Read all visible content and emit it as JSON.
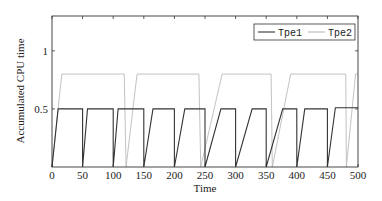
{
  "chart_data": {
    "type": "line",
    "title": "",
    "xlabel": "Time",
    "ylabel": "Accumulated CPU time",
    "xlim": [
      0,
      500
    ],
    "ylim": [
      0,
      1.3
    ],
    "x_ticks": [
      0,
      50,
      100,
      150,
      200,
      250,
      300,
      350,
      400,
      450,
      500
    ],
    "x_tick_labels": [
      "0",
      "50",
      "100",
      "150",
      "200",
      "250",
      "300",
      "350",
      "400",
      "450",
      "500"
    ],
    "y_ticks": [
      0.5,
      1
    ],
    "y_tick_labels": [
      "0.5",
      "1"
    ],
    "grid": false,
    "legend_position": "upper right",
    "series": [
      {
        "name": "Tpe1",
        "color": "#333333",
        "x": [
          0,
          10,
          50,
          50,
          58,
          100,
          100,
          108,
          150,
          150,
          165,
          200,
          200,
          217,
          250,
          250,
          276,
          300,
          300,
          327,
          350,
          350,
          377,
          400,
          400,
          413,
          450,
          450,
          463,
          500
        ],
        "y": [
          0,
          0.5,
          0.5,
          0,
          0.5,
          0.5,
          0,
          0.5,
          0.5,
          0,
          0.5,
          0.5,
          0,
          0.5,
          0.5,
          0,
          0.5,
          0.5,
          0,
          0.5,
          0.5,
          0,
          0.5,
          0.5,
          0,
          0.5,
          0.5,
          0,
          0.51,
          0.51
        ]
      },
      {
        "name": "Tpe2",
        "color": "#bbbbbb",
        "x": [
          0,
          16,
          118,
          121,
          139,
          240,
          243,
          278,
          358,
          360,
          390,
          480,
          481,
          496,
          500
        ],
        "y": [
          0,
          0.8,
          0.8,
          0,
          0.8,
          0.8,
          0,
          0.8,
          0.8,
          0,
          0.8,
          0.8,
          0,
          0.8,
          0.8
        ]
      }
    ]
  },
  "legend": {
    "items": [
      {
        "label": "Tpe1",
        "color": "#333333"
      },
      {
        "label": "Tpe2",
        "color": "#bbbbbb"
      }
    ]
  }
}
